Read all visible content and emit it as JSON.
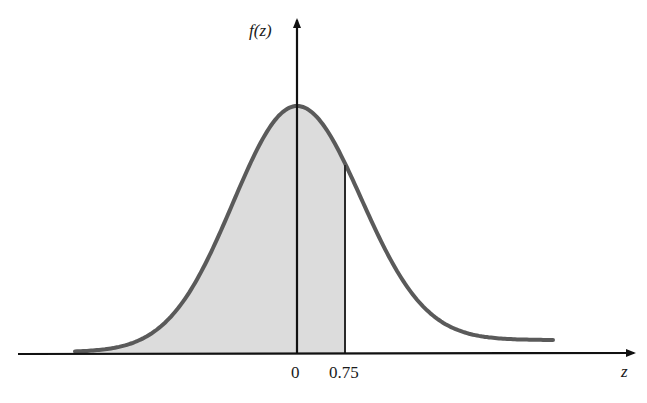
{
  "chart_data": {
    "type": "area",
    "title": "",
    "xlabel": "z",
    "ylabel": "f(z)",
    "x_ticks": [
      "0",
      "0.75"
    ],
    "shaded_region": {
      "from": "-inf",
      "to": 0.75
    },
    "curve": "standard normal pdf",
    "grid": false,
    "legend": null
  },
  "labels": {
    "y_axis": "f(z)",
    "x_axis": "z",
    "tick_zero": "0",
    "tick_cut": "0.75"
  },
  "colors": {
    "curve": "#5a5a5a",
    "fill": "#dcdcdc",
    "axis": "#111111"
  }
}
